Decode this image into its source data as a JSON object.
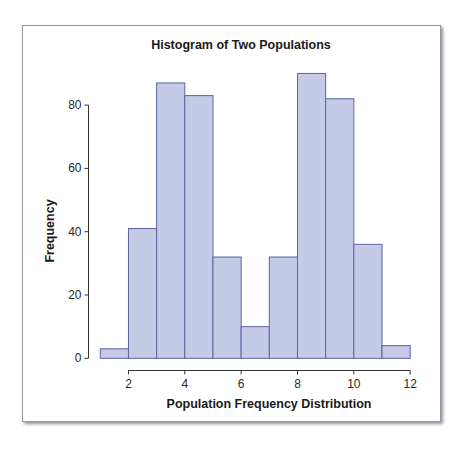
{
  "chart_data": {
    "type": "bar",
    "title": "Histogram of Two Populations",
    "xlabel": "Population Frequency Distribution",
    "ylabel": "Frequency",
    "bin_edges": [
      1,
      2,
      3,
      4,
      5,
      6,
      7,
      8,
      9,
      10,
      11,
      12
    ],
    "categories": [
      "1-2",
      "2-3",
      "3-4",
      "4-5",
      "5-6",
      "6-7",
      "7-8",
      "8-9",
      "9-10",
      "10-11",
      "11-12"
    ],
    "values": [
      3,
      41,
      87,
      83,
      32,
      10,
      32,
      90,
      82,
      36,
      4
    ],
    "xticks": [
      2,
      4,
      6,
      8,
      10,
      12
    ],
    "yticks": [
      0,
      20,
      40,
      60,
      80
    ],
    "xlim": [
      1,
      12
    ],
    "ylim": [
      0,
      80
    ],
    "grid": false,
    "legend": null
  },
  "colors": {
    "bar_fill": "#c5cae7",
    "bar_edge": "#5c64a2",
    "axis": "#333333",
    "frame_border": "#9095b4"
  }
}
